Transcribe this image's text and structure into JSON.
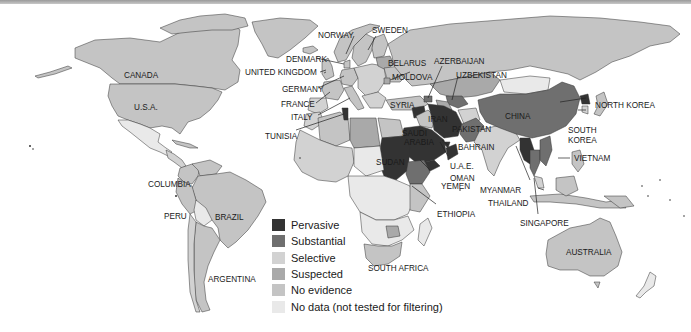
{
  "map": {
    "type": "choropleth",
    "subject": "Internet filtering by country",
    "colors": {
      "pervasive": "#333333",
      "substantial": "#6f6f6f",
      "selective": "#d2d2d2",
      "suspected": "#a9a9a9",
      "no_evidence": "#c4c4c4",
      "no_data": "#e9e9e9",
      "ocean": "#ffffff",
      "border": "#333333"
    }
  },
  "legend": {
    "items": [
      {
        "key": "pervasive",
        "label": "Pervasive",
        "color": "#333333"
      },
      {
        "key": "substantial",
        "label": "Substantial",
        "color": "#6f6f6f"
      },
      {
        "key": "selective",
        "label": "Selective",
        "color": "#d2d2d2"
      },
      {
        "key": "suspected",
        "label": "Suspected",
        "color": "#a9a9a9"
      },
      {
        "key": "no_evidence",
        "label": "No evidence",
        "color": "#c4c4c4"
      },
      {
        "key": "no_data",
        "label": "No data (not tested for filtering)",
        "color": "#e9e9e9"
      }
    ]
  },
  "labels": {
    "canada": "CANADA",
    "usa": "U.S.A.",
    "columbia": "COLUMBIA",
    "peru": "PERU",
    "brazil": "BRAZIL",
    "argentina": "ARGENTINA",
    "norway": "NORWAY",
    "sweden": "SWEDEN",
    "denmark": "DENMARK",
    "united_kingdom": "UNITED KINGDOM",
    "germany": "GERMANY",
    "france": "FRANCE",
    "italy": "ITALY",
    "tunisia": "TUNISIA",
    "belarus": "BELARUS",
    "moldova": "MOLDOVA",
    "azerbaijan": "AZERBAIJAN",
    "uzbekistan": "UZBEKISTAN",
    "syria": "SYRIA",
    "iran": "IRAN",
    "saudi_arabia_1": "SAUDI",
    "saudi_arabia_2": "ARABIA",
    "pakistan": "PAKISTAN",
    "china": "CHINA",
    "north_korea": "NORTH KOREA",
    "south_korea_1": "SOUTH",
    "south_korea_2": "KOREA",
    "bahrain": "BAHRAIN",
    "uae": "U.A.E.",
    "oman": "OMAN",
    "yemen": "YEMEN",
    "sudan": "SUDAN",
    "ethiopia": "ETHIOPIA",
    "myanmar": "MYANMAR",
    "thailand": "THAILAND",
    "vietnam": "VIETNAM",
    "singapore": "SINGAPORE",
    "south_africa": "SOUTH AFRICA",
    "australia": "AUSTRALIA"
  }
}
